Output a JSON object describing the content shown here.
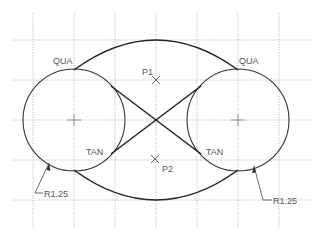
{
  "diagram": {
    "type": "cad-sketch",
    "colors": {
      "background": "#ffffff",
      "grid": "#9a9a9a",
      "geometry": "#333333",
      "text": "#555555"
    },
    "grid": {
      "x_lines": [
        33,
        74,
        115,
        156,
        197,
        238,
        279
      ],
      "y_lines": [
        40,
        80,
        120,
        160,
        200
      ],
      "x_extent": [
        13,
        311
      ],
      "y_extent": [
        13,
        228
      ]
    },
    "circles": [
      {
        "name": "left-circle",
        "cx": 74,
        "cy": 120,
        "r": 51
      },
      {
        "name": "right-circle",
        "cx": 238,
        "cy": 120,
        "r": 51
      }
    ],
    "points": [
      {
        "label": "P1",
        "x": 156,
        "y": 80
      },
      {
        "label": "P2",
        "x": 155,
        "y": 159
      }
    ],
    "labels": {
      "qua_left": "QUA",
      "qua_right": "QUA",
      "tan_left": "TAN",
      "tan_right": "TAN",
      "p1": "P1",
      "p2": "P2",
      "radius_left": "R1.25",
      "radius_right": "R1.25"
    }
  }
}
